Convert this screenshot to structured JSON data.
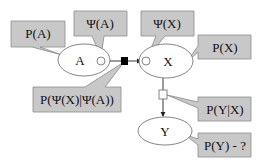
{
  "diagram": {
    "nodes": {
      "a": {
        "label": "A"
      },
      "x": {
        "label": "X"
      },
      "y": {
        "label": "Y"
      }
    },
    "callouts": {
      "p_a": "P(A)",
      "psi_a": "Ψ(A)",
      "psi_x": "Ψ(X)",
      "p_x": "P(X)",
      "p_psi_x_given_psi_a": "P(Ψ(X)|Ψ(A))",
      "p_y_given_x": "P(Y|X)",
      "p_y_query": "P(Y) - ?"
    },
    "colors": {
      "callout_fill": "#c8c8c8",
      "callout_stroke": "#8a8a8a",
      "line": "#222222",
      "factor_observed": "#000000",
      "factor_open": "#ffffff"
    }
  }
}
